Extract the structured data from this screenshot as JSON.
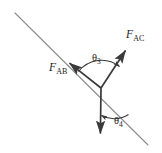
{
  "figure": {
    "type": "free-body-force-diagram",
    "canvas": {
      "width": 162,
      "height": 153,
      "background": "#ffffff"
    },
    "colors": {
      "vector_stroke": "#3a3a3a",
      "guide_line": "#8c8c8c",
      "arc_stroke": "#3a3a3a",
      "text": "#1a1a1a"
    },
    "vertex": {
      "x": 101,
      "y": 88
    },
    "guide_line": {
      "name": "inclined-reference-line",
      "from": {
        "x": 15,
        "y": 13
      },
      "to": {
        "x": 148,
        "y": 145
      },
      "style": "thin solid",
      "approx_angle_deg": 45
    },
    "vectors": [
      {
        "id": "F_AB",
        "label_main": "F",
        "label_sub": "AB",
        "from": {
          "x": 101,
          "y": 88
        },
        "to": {
          "x": 67,
          "y": 61
        },
        "direction": "up-left along inclined line",
        "arrowhead": "solid"
      },
      {
        "id": "F_AC",
        "label_main": "F",
        "label_sub": "AC",
        "from": {
          "x": 101,
          "y": 88
        },
        "to": {
          "x": 128,
          "y": 47
        },
        "direction": "up-right",
        "arrowhead": "solid"
      },
      {
        "id": "F_down",
        "label_main": "",
        "label_sub": "",
        "from": {
          "x": 101,
          "y": 88
        },
        "to": {
          "x": 100,
          "y": 141
        },
        "direction": "straight down",
        "arrowhead": "solid"
      }
    ],
    "angles": [
      {
        "id": "theta3",
        "label_main": "θ",
        "label_sub": "3",
        "between": [
          "F_AB",
          "F_AC"
        ],
        "arc_radius": 28,
        "label_position": {
          "x": 92,
          "y": 53
        }
      },
      {
        "id": "theta4",
        "label_main": "θ",
        "label_sub": "4",
        "between": [
          "F_down",
          "inclined-reference-line"
        ],
        "arc_radius": 26,
        "label_position": {
          "x": 114,
          "y": 116
        }
      }
    ]
  }
}
